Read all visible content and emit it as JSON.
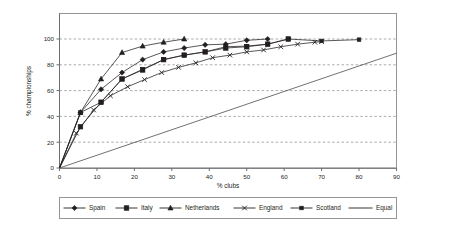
{
  "chart_data": {
    "type": "line",
    "title": "",
    "xlabel": "% clubs",
    "ylabel": "% championships",
    "xlim": [
      0,
      90
    ],
    "ylim": [
      0,
      110
    ],
    "xticks": [
      0,
      10,
      20,
      30,
      40,
      50,
      60,
      70,
      80,
      90
    ],
    "yticks": [
      0,
      20,
      40,
      60,
      80,
      100
    ],
    "grid": "horizontal-dashed",
    "legend_position": "bottom",
    "series": [
      {
        "name": "Spain",
        "marker": "diamond",
        "points": [
          [
            0,
            0
          ],
          [
            5.6,
            43
          ],
          [
            11.1,
            61
          ],
          [
            16.7,
            74
          ],
          [
            22.2,
            84
          ],
          [
            27.8,
            90
          ],
          [
            33.3,
            93
          ],
          [
            38.9,
            95.5
          ],
          [
            44.4,
            96
          ],
          [
            50,
            99
          ],
          [
            55.6,
            100
          ]
        ]
      },
      {
        "name": "Italy",
        "marker": "square",
        "points": [
          [
            0,
            0
          ],
          [
            5.6,
            32
          ],
          [
            11.1,
            51
          ],
          [
            16.7,
            69
          ],
          [
            22.2,
            76
          ],
          [
            27.8,
            84
          ],
          [
            33.3,
            87.5
          ],
          [
            38.9,
            90
          ],
          [
            44.4,
            93
          ],
          [
            50,
            94
          ],
          [
            55.6,
            96
          ],
          [
            61.1,
            100
          ]
        ]
      },
      {
        "name": "Netherlands",
        "marker": "triangle",
        "points": [
          [
            0,
            0
          ],
          [
            5.6,
            43
          ],
          [
            11.1,
            69
          ],
          [
            16.7,
            89.5
          ],
          [
            22.2,
            94.5
          ],
          [
            27.8,
            97.5
          ],
          [
            33.3,
            100
          ]
        ]
      },
      {
        "name": "England",
        "marker": "x",
        "points": [
          [
            0,
            0
          ],
          [
            4.5,
            27
          ],
          [
            9.1,
            45
          ],
          [
            13.6,
            56
          ],
          [
            18.2,
            63
          ],
          [
            22.7,
            68.5
          ],
          [
            27.3,
            74
          ],
          [
            31.8,
            78
          ],
          [
            36.4,
            81.5
          ],
          [
            40.9,
            85.5
          ],
          [
            45.5,
            87.5
          ],
          [
            50,
            90
          ],
          [
            54.5,
            91.5
          ],
          [
            59.1,
            94
          ],
          [
            63.6,
            96
          ],
          [
            68.2,
            97.5
          ],
          [
            70,
            98
          ]
        ]
      },
      {
        "name": "Scotland",
        "marker": "square-small",
        "points": [
          [
            0,
            0
          ],
          [
            5.6,
            43
          ],
          [
            11.1,
            51
          ],
          [
            16.7,
            69
          ],
          [
            22.2,
            76.5
          ],
          [
            27.8,
            84
          ],
          [
            33.3,
            87.5
          ],
          [
            38.9,
            90
          ],
          [
            44.4,
            94
          ],
          [
            50,
            94.5
          ],
          [
            55.6,
            96
          ],
          [
            61.1,
            100
          ],
          [
            70,
            98.5
          ],
          [
            80,
            99.5
          ]
        ]
      },
      {
        "name": "Equal",
        "marker": "none",
        "points": [
          [
            0,
            0
          ],
          [
            90,
            89
          ]
        ]
      }
    ],
    "legend": [
      {
        "label": "Spain",
        "marker": "diamond"
      },
      {
        "label": "Italy",
        "marker": "square"
      },
      {
        "label": "Netherlands",
        "marker": "triangle"
      },
      {
        "label": "England",
        "marker": "x"
      },
      {
        "label": "Scotland",
        "marker": "square-small"
      },
      {
        "label": "Equal",
        "marker": "none"
      }
    ]
  }
}
